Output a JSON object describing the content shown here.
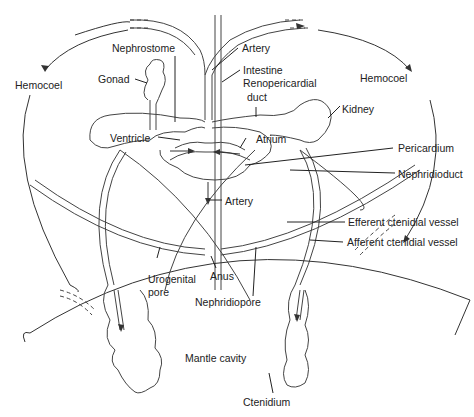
{
  "diagram": {
    "type": "anatomical-diagram",
    "labels": {
      "hemocoel_left": "Hemocoel",
      "hemocoel_right": "Hemocoel",
      "nephrostome": "Nephrostome",
      "gonad": "Gonad",
      "artery_top": "Artery",
      "intestine": "Intestine",
      "renopericardial_1": "Renopericardial",
      "renopericardial_2": "duct",
      "kidney": "Kidney",
      "ventricle": "Ventricle",
      "atrium": "Atrium",
      "pericardium": "Pericardium",
      "nephridioduct": "Nephridioduct",
      "artery_bottom": "Artery",
      "efferent": "Efferent ctenidial vessel",
      "afferent": "Afferent ctenidial vessel",
      "urogenital_1": "Urogenital",
      "urogenital_2": "pore",
      "anus": "Anus",
      "nephridiopore": "Nephridiopore",
      "mantle_cavity": "Mantle cavity",
      "ctenidium": "Ctenidium"
    },
    "colors": {
      "line": "#333333",
      "text": "#222222",
      "background": "#ffffff"
    }
  }
}
